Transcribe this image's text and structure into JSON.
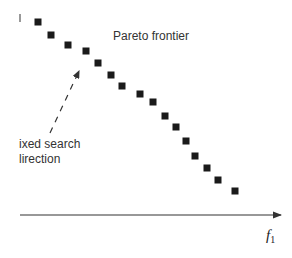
{
  "figure": {
    "title_label": "Pareto frontier",
    "search_label_line1": "ixed search",
    "search_label_line2": "lirection",
    "x_axis_label": "f",
    "x_axis_subscript": "1",
    "colors": {
      "points": "#1a1a1a",
      "axis": "#333333",
      "text": "#333333"
    }
  },
  "chart_data": {
    "type": "scatter",
    "title": "Pareto frontier",
    "xlabel": "f1",
    "ylabel": "",
    "annotations": [
      "Pareto frontier",
      "fixed search direction (dashed arrow)"
    ],
    "points_px": [
      [
        38,
        22
      ],
      [
        51,
        35
      ],
      [
        68,
        45
      ],
      [
        86,
        51
      ],
      [
        98,
        63
      ],
      [
        111,
        75
      ],
      [
        122,
        86
      ],
      [
        140,
        94
      ],
      [
        153,
        102
      ],
      [
        165,
        116
      ],
      [
        176,
        127
      ],
      [
        186,
        141
      ],
      [
        195,
        156
      ],
      [
        207,
        168
      ],
      [
        218,
        180
      ],
      [
        235,
        191
      ]
    ],
    "search_direction_arrow_px": {
      "from": [
        50,
        133
      ],
      "to": [
        79,
        71
      ]
    },
    "x_axis_px": {
      "from": [
        20,
        215
      ],
      "to": [
        281,
        215
      ]
    }
  }
}
